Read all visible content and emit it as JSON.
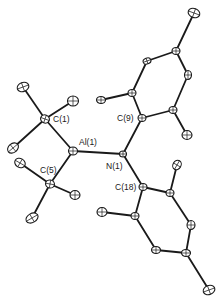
{
  "labels": {
    "c1": "C(1)",
    "al1": "Al(1)",
    "c5": "C(5)",
    "n1": "N(1)",
    "c9": "C(9)",
    "c18": "C(18)"
  },
  "atoms": [
    {
      "id": "C1",
      "x": 45,
      "y": 119,
      "rx": 4.5,
      "ry": 4,
      "rot": 20
    },
    {
      "id": "Al1",
      "x": 73,
      "y": 151,
      "rx": 4.5,
      "ry": 4,
      "rot": 0
    },
    {
      "id": "C5",
      "x": 50,
      "y": 184,
      "rx": 4.5,
      "ry": 4,
      "rot": 10
    },
    {
      "id": "N1",
      "x": 123,
      "y": 154,
      "rx": 3.5,
      "ry": 3,
      "rot": 0
    },
    {
      "id": "C9",
      "x": 142,
      "y": 118,
      "rx": 4,
      "ry": 3.5,
      "rot": 0
    },
    {
      "id": "C18",
      "x": 143,
      "y": 187,
      "rx": 4,
      "ry": 3.5,
      "rot": 0
    },
    {
      "id": "C1a",
      "x": 23,
      "y": 87,
      "rx": 6,
      "ry": 4.5,
      "rot": -20
    },
    {
      "id": "C1b",
      "x": 73,
      "y": 101,
      "rx": 5.5,
      "ry": 5,
      "rot": 0
    },
    {
      "id": "C1c",
      "x": 13,
      "y": 148,
      "rx": 6,
      "ry": 4.5,
      "rot": -40
    },
    {
      "id": "C5a",
      "x": 20,
      "y": 163,
      "rx": 5.5,
      "ry": 4.5,
      "rot": 30
    },
    {
      "id": "C5b",
      "x": 75,
      "y": 195,
      "rx": 5,
      "ry": 4.5,
      "rot": 0
    },
    {
      "id": "C5c",
      "x": 32,
      "y": 218,
      "rx": 6.5,
      "ry": 4.5,
      "rot": -30
    },
    {
      "id": "R1o1",
      "x": 132,
      "y": 93,
      "rx": 4,
      "ry": 3.5,
      "rot": 0
    },
    {
      "id": "R1m1",
      "x": 147,
      "y": 61,
      "rx": 4,
      "ry": 3,
      "rot": -20
    },
    {
      "id": "R1p",
      "x": 176,
      "y": 51,
      "rx": 4,
      "ry": 3.5,
      "rot": 0
    },
    {
      "id": "R1m2",
      "x": 188,
      "y": 75,
      "rx": 3.5,
      "ry": 4.5,
      "rot": 0
    },
    {
      "id": "R1o2",
      "x": 173,
      "y": 110,
      "rx": 4,
      "ry": 3.5,
      "rot": 0
    },
    {
      "id": "R1Me1",
      "x": 101,
      "y": 100,
      "rx": 4.5,
      "ry": 3.5,
      "rot": 0
    },
    {
      "id": "R1Me2",
      "x": 187,
      "y": 135,
      "rx": 5,
      "ry": 4.5,
      "rot": 0
    },
    {
      "id": "R1Me3",
      "x": 194,
      "y": 13,
      "rx": 6,
      "ry": 4.5,
      "rot": 20
    },
    {
      "id": "R2o1",
      "x": 135,
      "y": 216,
      "rx": 4,
      "ry": 3.5,
      "rot": 0
    },
    {
      "id": "R2m1",
      "x": 156,
      "y": 250,
      "rx": 4.5,
      "ry": 3.5,
      "rot": 0
    },
    {
      "id": "R2p",
      "x": 186,
      "y": 253,
      "rx": 4.5,
      "ry": 3.5,
      "rot": 0
    },
    {
      "id": "R2m2",
      "x": 191,
      "y": 225,
      "rx": 4,
      "ry": 4.5,
      "rot": 0
    },
    {
      "id": "R2o2",
      "x": 170,
      "y": 193,
      "rx": 4,
      "ry": 3.5,
      "rot": 0
    },
    {
      "id": "R2Me1",
      "x": 102,
      "y": 212,
      "rx": 5,
      "ry": 4.5,
      "rot": 0
    },
    {
      "id": "R2Me2",
      "x": 177,
      "y": 165,
      "rx": 4,
      "ry": 5,
      "rot": 30
    },
    {
      "id": "R2Me3",
      "x": 209,
      "y": 290,
      "rx": 6,
      "ry": 4.5,
      "rot": -20
    }
  ],
  "bonds": [
    [
      "C1",
      "Al1"
    ],
    [
      "C1",
      "C1a"
    ],
    [
      "C1",
      "C1b"
    ],
    [
      "C1",
      "C1c"
    ],
    [
      "Al1",
      "C5"
    ],
    [
      "C5",
      "C5a"
    ],
    [
      "C5",
      "C5b"
    ],
    [
      "C5",
      "C5c"
    ],
    [
      "Al1",
      "N1"
    ],
    [
      "N1",
      "C9"
    ],
    [
      "N1",
      "C18"
    ],
    [
      "C9",
      "R1o1"
    ],
    [
      "R1o1",
      "R1m1"
    ],
    [
      "R1m1",
      "R1p"
    ],
    [
      "R1p",
      "R1m2"
    ],
    [
      "R1m2",
      "R1o2"
    ],
    [
      "R1o2",
      "C9"
    ],
    [
      "R1o1",
      "R1Me1"
    ],
    [
      "R1o2",
      "R1Me2"
    ],
    [
      "R1p",
      "R1Me3"
    ],
    [
      "C18",
      "R2o1"
    ],
    [
      "R2o1",
      "R2m1"
    ],
    [
      "R2m1",
      "R2p"
    ],
    [
      "R2p",
      "R2m2"
    ],
    [
      "R2m2",
      "R2o2"
    ],
    [
      "R2o2",
      "C18"
    ],
    [
      "R2o1",
      "R2Me1"
    ],
    [
      "R2o2",
      "R2Me2"
    ],
    [
      "R2p",
      "R2Me3"
    ]
  ]
}
